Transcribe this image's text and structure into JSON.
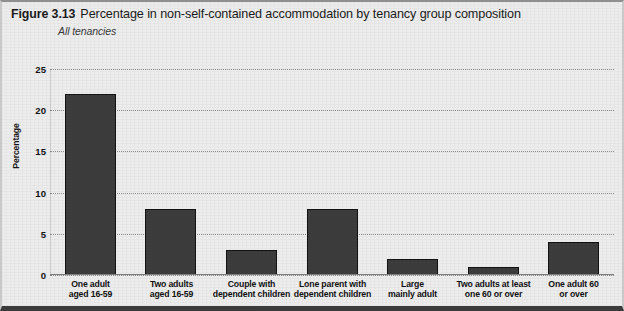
{
  "figure": {
    "number": "Figure 3.13",
    "title": "Percentage in non-self-contained accommodation by tenancy group composition",
    "subtitle": "All tenancies"
  },
  "chart_data": {
    "type": "bar",
    "title": "Percentage in non-self-contained accommodation by tenancy group composition",
    "subtitle": "All tenancies",
    "xlabel": "",
    "ylabel": "Percentage",
    "ylim": [
      0,
      25
    ],
    "yticks": [
      0,
      5,
      10,
      15,
      20,
      25
    ],
    "grid": true,
    "legend": false,
    "bar_color": "#3c3c3c",
    "categories": [
      "One adult aged 16-59",
      "Two adults aged 16-59",
      "Couple with dependent children",
      "Lone parent with dependent children",
      "Large mainly adult",
      "Two adults at least one 60 or over",
      "One adult 60 or over"
    ],
    "category_lines": [
      [
        "One adult",
        "aged 16-59"
      ],
      [
        "Two adults",
        "aged 16-59"
      ],
      [
        "Couple with",
        "dependent children"
      ],
      [
        "Lone parent with",
        "dependent children"
      ],
      [
        "Large",
        "mainly adult"
      ],
      [
        "Two adults at least",
        "one 60 or over"
      ],
      [
        "One adult 60",
        "or over"
      ]
    ],
    "values": [
      22,
      8,
      3,
      8,
      2,
      1,
      4
    ]
  },
  "yticks_labels": [
    "0",
    "5",
    "10",
    "15",
    "20",
    "25"
  ],
  "axis": {
    "y_title": "Percentage"
  }
}
